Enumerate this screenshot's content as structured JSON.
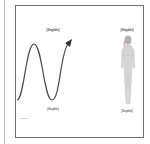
{
  "diagram": {
    "left_panel": {
      "header": "[illegible]",
      "caption": "[illegible]",
      "subcaption": "[illegible]",
      "graphic": "sine-wave-arrow",
      "stroke_color": "#4a4a4a"
    },
    "right_panel": {
      "header": "[illegible]",
      "caption": "[illegible]",
      "graphic": "standing-human-figure",
      "fill_color": "#d8d4d2"
    },
    "frame_color": "#6e6e6e"
  }
}
